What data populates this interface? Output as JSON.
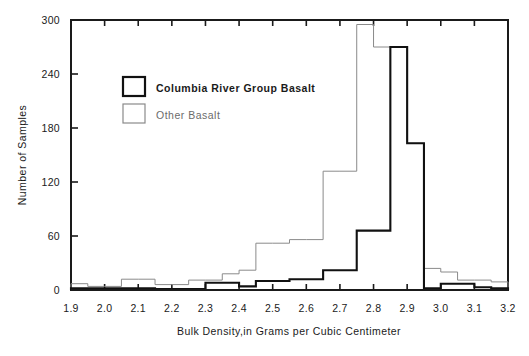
{
  "chart_data": {
    "type": "bar",
    "subtype": "step-histogram-overlay",
    "title": "",
    "xlabel": "Bulk Density,in Grams per Cubic Centimeter",
    "ylabel": "Number of Samples",
    "xlim": [
      1.9,
      3.2
    ],
    "ylim": [
      0,
      300
    ],
    "bin_width": 0.05,
    "grid": false,
    "legend_position": "upper-left-inside",
    "xticks": [
      "1.9",
      "2.0",
      "2.1",
      "2.2",
      "2.3",
      "2.4",
      "2.5",
      "2.6",
      "2.7",
      "2.8",
      "2.9",
      "3.0",
      "3.1",
      "3.2"
    ],
    "xtick_values": [
      1.9,
      2.0,
      2.1,
      2.2,
      2.3,
      2.4,
      2.5,
      2.6,
      2.7,
      2.8,
      2.9,
      3.0,
      3.1,
      3.2
    ],
    "yticks": [
      "0",
      "60",
      "120",
      "180",
      "240",
      "300"
    ],
    "ytick_values": [
      0,
      60,
      120,
      180,
      240,
      300
    ],
    "bin_edges": [
      1.9,
      1.95,
      2.0,
      2.05,
      2.1,
      2.15,
      2.2,
      2.25,
      2.3,
      2.35,
      2.4,
      2.45,
      2.5,
      2.55,
      2.6,
      2.65,
      2.7,
      2.75,
      2.8,
      2.85,
      2.9,
      2.95,
      3.0,
      3.05,
      3.1,
      3.15,
      3.2
    ],
    "series": [
      {
        "name": "Other Basalt",
        "color": "#8a8a8a",
        "line_width": 1,
        "values": [
          7,
          4,
          4,
          12,
          12,
          6,
          6,
          11,
          11,
          18,
          22,
          52,
          52,
          56,
          56,
          132,
          132,
          295,
          270,
          270,
          163,
          24,
          20,
          11,
          11,
          9
        ]
      },
      {
        "name": "Columbia River Group Basalt",
        "color": "#111111",
        "line_width": 2.1,
        "values": [
          2,
          2,
          2,
          2,
          2,
          1,
          1,
          1,
          8,
          8,
          4,
          10,
          10,
          12,
          12,
          22,
          22,
          66,
          66,
          270,
          163,
          2,
          7,
          7,
          3,
          2
        ]
      }
    ]
  },
  "legend": {
    "items": [
      {
        "label": "Columbia River Group Basalt",
        "color": "#111111",
        "style": "bold-box"
      },
      {
        "label": "Other Basalt",
        "color": "#8a8a8a",
        "style": "thin-box"
      }
    ]
  },
  "axes": {
    "y_title": "Number of Samples",
    "x_title": "Bulk Density,in Grams per Cubic Centimeter"
  },
  "colors": {
    "primary": "#111111",
    "secondary": "#8a8a8a",
    "background": "#ffffff",
    "axis": "#1a1a1a"
  }
}
